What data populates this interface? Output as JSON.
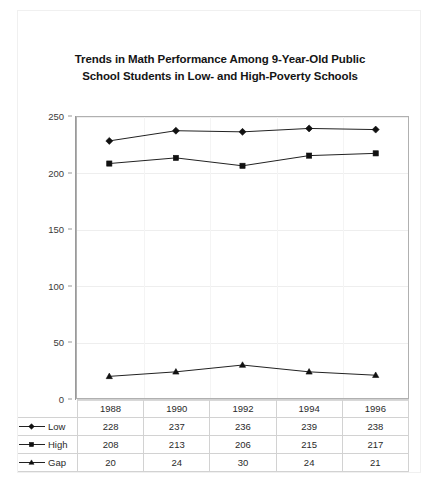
{
  "chart_data": {
    "type": "line",
    "title": "Trends in Math Performance Among 9-Year-Old Public School Students in Low- and High-Poverty Schools",
    "title_lines": [
      "Trends in Math Performance Among 9-Year-Old Public",
      "School Students in Low- and High-Poverty Schools"
    ],
    "xlabel": "",
    "ylabel": "",
    "categories": [
      "1988",
      "1990",
      "1992",
      "1994",
      "1996"
    ],
    "ylim": [
      0,
      250
    ],
    "yticks": [
      0,
      50,
      100,
      150,
      200,
      250
    ],
    "ytick_labels": [
      "0",
      "50",
      "100",
      "150",
      "200",
      "250"
    ],
    "grid": true,
    "legend_position": "data-table-left",
    "series": [
      {
        "name": "Low",
        "marker": "diamond",
        "color": "#111111",
        "values": [
          228,
          237,
          236,
          239,
          238
        ]
      },
      {
        "name": "High",
        "marker": "square",
        "color": "#111111",
        "values": [
          208,
          213,
          206,
          215,
          217
        ]
      },
      {
        "name": "Gap",
        "marker": "triangle",
        "color": "#111111",
        "values": [
          20,
          24,
          30,
          24,
          21
        ]
      }
    ]
  },
  "table": {
    "header_row": [
      "1988",
      "1990",
      "1992",
      "1994",
      "1996"
    ],
    "rows": [
      {
        "label": "Low",
        "marker": "diamond",
        "cells": [
          "228",
          "237",
          "236",
          "239",
          "238"
        ]
      },
      {
        "label": "High",
        "marker": "square",
        "cells": [
          "208",
          "213",
          "206",
          "215",
          "217"
        ]
      },
      {
        "label": "Gap",
        "marker": "triangle",
        "cells": [
          "20",
          "24",
          "30",
          "24",
          "21"
        ]
      }
    ]
  }
}
